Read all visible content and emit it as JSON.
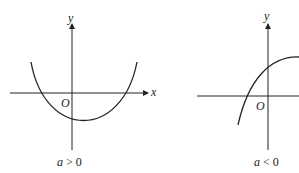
{
  "graphs": [
    {
      "id": "a-positive",
      "axis_x_label": "x",
      "axis_y_label": "y",
      "origin_label": "O",
      "condition_var": "a",
      "condition_op": ">",
      "condition_val": "0",
      "curve": "upward parabola, vertex right of y-axis below x-axis, two x-intercepts"
    },
    {
      "id": "a-negative",
      "axis_x_label": "x",
      "axis_y_label": "y",
      "origin_label": "O",
      "condition_var": "a",
      "condition_op": "<",
      "condition_val": "0",
      "curve": "downward parabola, vertex right of y-axis above x-axis, positive y-intercept"
    }
  ],
  "colors": {
    "ink": "#222222",
    "background": "#ffffff"
  }
}
